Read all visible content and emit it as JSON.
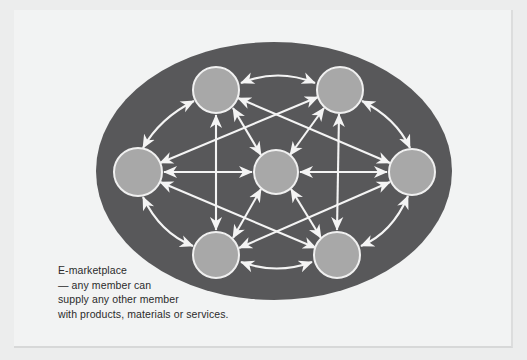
{
  "page": {
    "background_color": "#eceded",
    "card_color": "#f2f3f3"
  },
  "diagram": {
    "name": "e-marketplace-network",
    "type": "node-link-network",
    "backdrop": {
      "shape": "ellipse",
      "color": "#58585a",
      "cx": 274,
      "cy": 171,
      "rx": 178,
      "ry": 129
    },
    "node_style": {
      "fill": "#a8a8a8",
      "stroke": "#f0f0f0",
      "stroke_width": 2
    },
    "arrow_color": "#f4f4f4",
    "nodes": [
      {
        "id": "top-left",
        "label": "",
        "cx": 216,
        "cy": 90,
        "r": 23
      },
      {
        "id": "top-right",
        "label": "",
        "cx": 340,
        "cy": 90,
        "r": 23
      },
      {
        "id": "left",
        "label": "",
        "cx": 138,
        "cy": 172,
        "r": 24
      },
      {
        "id": "center",
        "label": "",
        "cx": 276,
        "cy": 172,
        "r": 22
      },
      {
        "id": "right",
        "label": "",
        "cx": 412,
        "cy": 172,
        "r": 23
      },
      {
        "id": "bottom-left",
        "label": "",
        "cx": 216,
        "cy": 255,
        "r": 23
      },
      {
        "id": "bottom-right",
        "label": "",
        "cx": 337,
        "cy": 255,
        "r": 23
      }
    ],
    "links": [
      {
        "from": "top-left",
        "to": "top-right",
        "bidirectional": true,
        "curve": "arc"
      },
      {
        "from": "top-left",
        "to": "left",
        "bidirectional": true,
        "curve": "arc"
      },
      {
        "from": "top-right",
        "to": "right",
        "bidirectional": true,
        "curve": "arc"
      },
      {
        "from": "left",
        "to": "bottom-left",
        "bidirectional": true,
        "curve": "arc"
      },
      {
        "from": "right",
        "to": "bottom-right",
        "bidirectional": true,
        "curve": "arc"
      },
      {
        "from": "bottom-left",
        "to": "bottom-right",
        "bidirectional": true,
        "curve": "arc"
      },
      {
        "from": "left",
        "to": "center",
        "bidirectional": true,
        "curve": "straight"
      },
      {
        "from": "center",
        "to": "right",
        "bidirectional": true,
        "curve": "straight"
      },
      {
        "from": "top-left",
        "to": "bottom-left",
        "bidirectional": true,
        "curve": "straight"
      },
      {
        "from": "top-right",
        "to": "bottom-right",
        "bidirectional": true,
        "curve": "straight"
      },
      {
        "from": "top-left",
        "to": "center",
        "bidirectional": true,
        "curve": "straight"
      },
      {
        "from": "top-right",
        "to": "center",
        "bidirectional": true,
        "curve": "straight"
      },
      {
        "from": "bottom-left",
        "to": "center",
        "bidirectional": true,
        "curve": "straight"
      },
      {
        "from": "bottom-right",
        "to": "center",
        "bidirectional": true,
        "curve": "straight"
      },
      {
        "from": "left",
        "to": "top-right",
        "bidirectional": true,
        "curve": "straight"
      },
      {
        "from": "left",
        "to": "bottom-right",
        "bidirectional": true,
        "curve": "straight"
      },
      {
        "from": "right",
        "to": "top-left",
        "bidirectional": true,
        "curve": "straight"
      },
      {
        "from": "right",
        "to": "bottom-left",
        "bidirectional": true,
        "curve": "straight"
      }
    ]
  },
  "caption": {
    "color": "#2b2b2b",
    "lines": [
      "E-marketplace",
      "— any member can",
      "supply any other member",
      "with products, materials or services."
    ],
    "line1": "E-marketplace",
    "line2": "— any member can",
    "line3": "supply any other member",
    "line4": "with products, materials or services."
  }
}
